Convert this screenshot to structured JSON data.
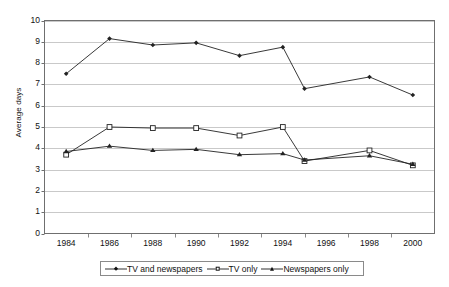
{
  "chart_data": {
    "type": "line",
    "title": "",
    "xlabel": "",
    "ylabel": "Average days",
    "x": [
      1984,
      1986,
      1988,
      1990,
      1992,
      1994,
      1995,
      1998,
      2000
    ],
    "xlim": [
      1983,
      2001
    ],
    "ylim": [
      0,
      10
    ],
    "xticks": [
      1984,
      1986,
      1988,
      1990,
      1992,
      1994,
      1996,
      1998,
      2000
    ],
    "xtick_labels": [
      "1984",
      "1986",
      "1988",
      "1990",
      "1992",
      "1994",
      "1996",
      "1998",
      "2000"
    ],
    "yticks": [
      0,
      1,
      2,
      3,
      4,
      5,
      6,
      7,
      8,
      9,
      10
    ],
    "ytick_labels": [
      "0",
      "1",
      "2",
      "3",
      "4",
      "5",
      "6",
      "7",
      "8",
      "9",
      "10"
    ],
    "grid": "horizontal",
    "legend_position": "bottom-center",
    "series": [
      {
        "name": "TV and newspapers",
        "marker": "diamond",
        "color": "#222222",
        "values": [
          7.5,
          9.15,
          8.85,
          8.95,
          8.35,
          8.75,
          6.8,
          7.35,
          6.5
        ]
      },
      {
        "name": "TV only",
        "marker": "square-open",
        "color": "#222222",
        "values": [
          3.7,
          5.0,
          4.95,
          4.95,
          4.6,
          5.0,
          3.4,
          3.9,
          3.2
        ]
      },
      {
        "name": "Newspapers only",
        "marker": "triangle",
        "color": "#222222",
        "values": [
          3.85,
          4.1,
          3.9,
          3.95,
          3.7,
          3.75,
          3.45,
          3.65,
          3.25
        ]
      }
    ]
  },
  "axes": {
    "y_title": "Average days"
  },
  "legend": {
    "items": [
      {
        "label": "TV and newspapers",
        "marker": "diamond"
      },
      {
        "label": "TV only",
        "marker": "square-open"
      },
      {
        "label": "Newspapers only",
        "marker": "triangle"
      }
    ]
  }
}
